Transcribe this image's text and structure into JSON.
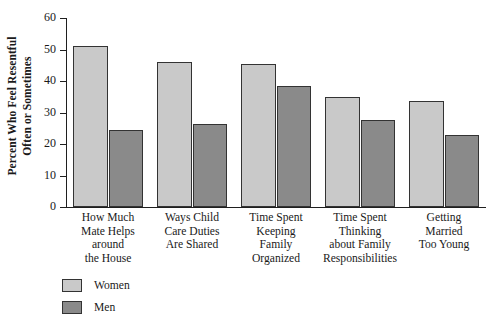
{
  "chart_data": {
    "type": "bar",
    "title": "",
    "subtitle": "",
    "xlabel": "",
    "ylabel": "Percent Who Feel Resentful Often or Sometimes",
    "ylabel_lines": [
      "Percent Who Feel Resentful",
      "Often or Sometimes"
    ],
    "ylim": [
      0,
      60
    ],
    "yticks": [
      0,
      10,
      20,
      30,
      40,
      50,
      60
    ],
    "ytick_labels": [
      "0",
      "10",
      "20",
      "30",
      "40",
      "50",
      "60"
    ],
    "grid": false,
    "legend_position": "bottom-left",
    "categories": [
      "How Much Mate Helps around the House",
      "Ways Child Care Duties Are Shared",
      "Time Spent Keeping Family Organized",
      "Time Spent Thinking about Family Responsibilities",
      "Getting Married Too Young"
    ],
    "category_lines": [
      [
        "How Much",
        "Mate Helps",
        "around",
        "the House"
      ],
      [
        "Ways Child",
        "Care Duties",
        "Are Shared"
      ],
      [
        "Time Spent",
        "Keeping",
        "Family",
        "Organized"
      ],
      [
        "Time Spent",
        "Thinking",
        "about Family",
        "Responsibilities"
      ],
      [
        "Getting",
        "Married",
        "Too Young"
      ]
    ],
    "series": [
      {
        "name": "Women",
        "color": "#c9c9c9",
        "values": [
          51,
          46,
          45.5,
          35,
          33.5
        ]
      },
      {
        "name": "Men",
        "color": "#8a8a8a",
        "values": [
          24.5,
          26.5,
          38.5,
          27.5,
          23
        ]
      }
    ]
  },
  "legend": {
    "items": [
      {
        "label": "Women",
        "color": "#c9c9c9"
      },
      {
        "label": "Men",
        "color": "#8a8a8a"
      }
    ]
  }
}
